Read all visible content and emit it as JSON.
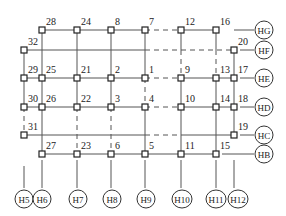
{
  "diagram": {
    "title": "",
    "line_color": "#555555",
    "node_color": "#222222",
    "columns": {
      "H5": 24,
      "H6": 42,
      "H7": 77,
      "H8": 111,
      "H9": 145,
      "H10": 181,
      "H11": 216,
      "H12": 234
    },
    "rows": {
      "HG": 30,
      "HF": 50,
      "HE": 78,
      "HD": 107,
      "HC": 135,
      "HB": 154
    },
    "nodes": [
      {
        "id": "28",
        "x": 42,
        "y": 30
      },
      {
        "id": "24",
        "x": 77,
        "y": 30
      },
      {
        "id": "8",
        "x": 111,
        "y": 30
      },
      {
        "id": "7",
        "x": 145,
        "y": 30
      },
      {
        "id": "12",
        "x": 181,
        "y": 30
      },
      {
        "id": "16",
        "x": 216,
        "y": 30
      },
      {
        "id": "32",
        "x": 24,
        "y": 50
      },
      {
        "id": "20",
        "x": 234,
        "y": 50
      },
      {
        "id": "29",
        "x": 24,
        "y": 78
      },
      {
        "id": "25",
        "x": 42,
        "y": 78
      },
      {
        "id": "21",
        "x": 77,
        "y": 78
      },
      {
        "id": "2",
        "x": 111,
        "y": 78
      },
      {
        "id": "1",
        "x": 145,
        "y": 78
      },
      {
        "id": "9",
        "x": 181,
        "y": 78
      },
      {
        "id": "13",
        "x": 216,
        "y": 78
      },
      {
        "id": "17",
        "x": 234,
        "y": 78
      },
      {
        "id": "30",
        "x": 24,
        "y": 107
      },
      {
        "id": "26",
        "x": 42,
        "y": 107
      },
      {
        "id": "22",
        "x": 77,
        "y": 107
      },
      {
        "id": "3",
        "x": 111,
        "y": 107
      },
      {
        "id": "4",
        "x": 145,
        "y": 107
      },
      {
        "id": "10",
        "x": 181,
        "y": 107
      },
      {
        "id": "14",
        "x": 216,
        "y": 107
      },
      {
        "id": "18",
        "x": 234,
        "y": 107
      },
      {
        "id": "31",
        "x": 24,
        "y": 135
      },
      {
        "id": "19",
        "x": 234,
        "y": 135
      },
      {
        "id": "27",
        "x": 42,
        "y": 154
      },
      {
        "id": "23",
        "x": 77,
        "y": 154
      },
      {
        "id": "6",
        "x": 111,
        "y": 154
      },
      {
        "id": "5",
        "x": 145,
        "y": 154
      },
      {
        "id": "11",
        "x": 181,
        "y": 154
      },
      {
        "id": "15",
        "x": 216,
        "y": 154
      }
    ],
    "solid_lines": [
      [
        42,
        30,
        145,
        30
      ],
      [
        181,
        30,
        216,
        30
      ],
      [
        24,
        50,
        145,
        50
      ],
      [
        24,
        78,
        145,
        78
      ],
      [
        181,
        78,
        234,
        78
      ],
      [
        24,
        107,
        145,
        107
      ],
      [
        181,
        107,
        234,
        107
      ],
      [
        24,
        135,
        145,
        135
      ],
      [
        181,
        135,
        234,
        135
      ],
      [
        42,
        154,
        216,
        154
      ],
      [
        24,
        50,
        24,
        107
      ],
      [
        42,
        30,
        42,
        154
      ],
      [
        77,
        30,
        77,
        107
      ],
      [
        111,
        30,
        111,
        107
      ],
      [
        145,
        30,
        145,
        78
      ],
      [
        145,
        107,
        145,
        154
      ],
      [
        181,
        30,
        181,
        50
      ],
      [
        181,
        78,
        181,
        154
      ],
      [
        216,
        30,
        216,
        50
      ],
      [
        216,
        78,
        216,
        154
      ],
      [
        234,
        50,
        234,
        135
      ],
      [
        234,
        30,
        254,
        30
      ],
      [
        240,
        50,
        254,
        50
      ],
      [
        240,
        78,
        254,
        78
      ],
      [
        240,
        107,
        254,
        107
      ],
      [
        240,
        135,
        254,
        135
      ],
      [
        222,
        154,
        254,
        154
      ],
      [
        24,
        166,
        24,
        188
      ],
      [
        42,
        160,
        42,
        188
      ],
      [
        77,
        160,
        77,
        188
      ],
      [
        111,
        160,
        111,
        188
      ],
      [
        145,
        160,
        145,
        188
      ],
      [
        181,
        160,
        181,
        188
      ],
      [
        216,
        160,
        216,
        188
      ],
      [
        234,
        160,
        234,
        188
      ]
    ],
    "dashed_lines": [
      [
        145,
        30,
        181,
        30
      ],
      [
        145,
        50,
        234,
        50
      ],
      [
        145,
        78,
        181,
        78
      ],
      [
        145,
        107,
        181,
        107
      ],
      [
        145,
        135,
        181,
        135
      ],
      [
        24,
        107,
        24,
        135
      ],
      [
        77,
        107,
        77,
        154
      ],
      [
        111,
        107,
        111,
        154
      ],
      [
        145,
        78,
        145,
        107
      ],
      [
        181,
        50,
        181,
        78
      ],
      [
        216,
        50,
        216,
        78
      ]
    ],
    "bottom_axes": [
      {
        "label": "H5",
        "x": 24,
        "y": 199
      },
      {
        "label": "H6",
        "x": 42,
        "y": 199
      },
      {
        "label": "H7",
        "x": 78,
        "y": 199
      },
      {
        "label": "H8",
        "x": 112,
        "y": 199
      },
      {
        "label": "H9",
        "x": 146,
        "y": 199
      },
      {
        "label": "H10",
        "x": 182,
        "y": 199
      },
      {
        "label": "H11",
        "x": 216,
        "y": 199
      },
      {
        "label": "H12",
        "x": 238,
        "y": 199
      }
    ],
    "right_axes": [
      {
        "label": "HG",
        "x": 264,
        "y": 30
      },
      {
        "label": "HF",
        "x": 264,
        "y": 50
      },
      {
        "label": "HE",
        "x": 264,
        "y": 78
      },
      {
        "label": "HD",
        "x": 264,
        "y": 107
      },
      {
        "label": "HC",
        "x": 264,
        "y": 135
      },
      {
        "label": "HB",
        "x": 264,
        "y": 154
      }
    ]
  }
}
